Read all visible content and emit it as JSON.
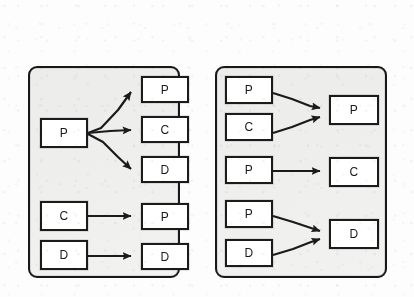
{
  "figure": {
    "name": "two-panel-mapping-diagram",
    "background_color": "#fdfdfd",
    "panel_fill_color": "#f1f1ef",
    "stroke_color": "#1b1b1b",
    "node_fill_color": "#ffffff"
  },
  "panels": [
    {
      "id": "left-panel",
      "name": "one-to-many-panel",
      "source_nodes": [
        {
          "id": "l-src-1",
          "label": "P"
        },
        {
          "id": "l-src-2",
          "label": "C"
        },
        {
          "id": "l-src-3",
          "label": "D"
        }
      ],
      "target_nodes": [
        {
          "id": "l-tgt-1",
          "label": "P"
        },
        {
          "id": "l-tgt-2",
          "label": "C"
        },
        {
          "id": "l-tgt-3",
          "label": "D"
        },
        {
          "id": "l-tgt-4",
          "label": "P"
        },
        {
          "id": "l-tgt-5",
          "label": "D"
        }
      ],
      "edges": [
        {
          "from": "l-src-1",
          "to": "l-tgt-1"
        },
        {
          "from": "l-src-1",
          "to": "l-tgt-2"
        },
        {
          "from": "l-src-1",
          "to": "l-tgt-3"
        },
        {
          "from": "l-src-2",
          "to": "l-tgt-4"
        },
        {
          "from": "l-src-3",
          "to": "l-tgt-5"
        }
      ]
    },
    {
      "id": "right-panel",
      "name": "many-to-one-panel",
      "source_nodes": [
        {
          "id": "r-src-1",
          "label": "P"
        },
        {
          "id": "r-src-2",
          "label": "C"
        },
        {
          "id": "r-src-3",
          "label": "P"
        },
        {
          "id": "r-src-4",
          "label": "P"
        },
        {
          "id": "r-src-5",
          "label": "D"
        }
      ],
      "target_nodes": [
        {
          "id": "r-tgt-1",
          "label": "P"
        },
        {
          "id": "r-tgt-2",
          "label": "C"
        },
        {
          "id": "r-tgt-3",
          "label": "D"
        }
      ],
      "edges": [
        {
          "from": "r-src-1",
          "to": "r-tgt-1"
        },
        {
          "from": "r-src-2",
          "to": "r-tgt-1"
        },
        {
          "from": "r-src-3",
          "to": "r-tgt-2"
        },
        {
          "from": "r-src-4",
          "to": "r-tgt-3"
        },
        {
          "from": "r-src-5",
          "to": "r-tgt-3"
        }
      ]
    }
  ]
}
